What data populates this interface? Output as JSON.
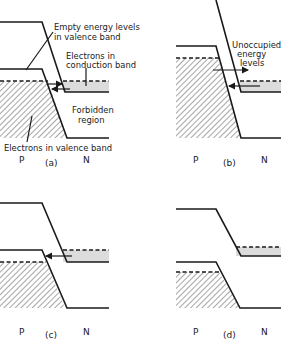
{
  "figure": {
    "colors": {
      "line": "#1a1a1a",
      "conduction_fill": "#dcdcdc",
      "hatch": "#3a3a3a",
      "background": "#ffffff"
    },
    "panels": [
      {
        "id": "a",
        "caption": "(a)",
        "left_label": "P",
        "right_label": "N",
        "annotations": {
          "empty_levels_line1": "Empty energy levels",
          "empty_levels_line2": "in valence band",
          "electrons_conduction_line1": "Electrons in",
          "electrons_conduction_line2": "conduction band",
          "forbidden_line1": "Forbidden",
          "forbidden_line2": "region",
          "electrons_valence": "Electrons in valence band"
        }
      },
      {
        "id": "b",
        "caption": "(b)",
        "left_label": "P",
        "right_label": "N",
        "annotations": {
          "unoccupied_line1": "Unoccupied",
          "unoccupied_line2": "energy",
          "unoccupied_line3": "levels"
        }
      },
      {
        "id": "c",
        "caption": "(c)",
        "left_label": "P",
        "right_label": "N"
      },
      {
        "id": "d",
        "caption": "(d)",
        "left_label": "P",
        "right_label": "N"
      }
    ]
  }
}
